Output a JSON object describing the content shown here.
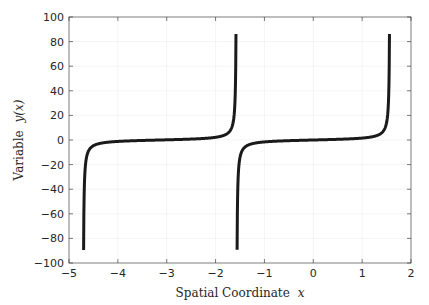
{
  "chart_data": {
    "type": "line",
    "title": "",
    "xlabel": "Spatial Coordinate",
    "xlabel_math": "x",
    "ylabel": "Variable",
    "ylabel_math": "y(x)",
    "xlim": [
      -5,
      2
    ],
    "ylim": [
      -100,
      100
    ],
    "xticks": [
      -5,
      -4,
      -3,
      -2,
      -1,
      0,
      1,
      2
    ],
    "xtick_labels": [
      "−5",
      "−4",
      "−3",
      "−2",
      "−1",
      "0",
      "1",
      "2"
    ],
    "yticks": [
      -100,
      -80,
      -60,
      -40,
      -20,
      0,
      20,
      40,
      60,
      80,
      100
    ],
    "ytick_labels": [
      "−100",
      "−80",
      "−60",
      "−40",
      "−20",
      "0",
      "20",
      "40",
      "60",
      "80",
      "100"
    ],
    "grid": true,
    "legend": "none",
    "function": "y = tan(x)",
    "series": [
      {
        "name": "branch-1",
        "color": "#1a1a1a",
        "x_range": [
          -4.7012,
          -1.5824
        ],
        "description": "tan(x) branch between asymptotes at -3π/2 and -π/2",
        "points": [
          [
            -4.7012,
            -100
          ],
          [
            -4.7,
            -85
          ],
          [
            -4.69,
            -50
          ],
          [
            -4.67,
            -25
          ],
          [
            -4.62,
            -11
          ],
          [
            -4.5,
            -4.6
          ],
          [
            -4.3,
            -2.3
          ],
          [
            -4.0,
            -1.16
          ],
          [
            -3.6,
            -0.49
          ],
          [
            -3.14,
            0
          ],
          [
            -2.7,
            0.47
          ],
          [
            -2.3,
            1.12
          ],
          [
            -2.0,
            2.19
          ],
          [
            -1.8,
            4.29
          ],
          [
            -1.7,
            7.7
          ],
          [
            -1.65,
            12.6
          ],
          [
            -1.61,
            25.5
          ],
          [
            -1.59,
            52
          ],
          [
            -1.5824,
            86
          ]
        ]
      },
      {
        "name": "branch-2",
        "color": "#1a1a1a",
        "x_range": [
          -1.5596,
          1.5592
        ],
        "description": "tan(x) branch between asymptotes at -π/2 and π/2",
        "points": [
          [
            -1.5608,
            -100
          ],
          [
            -1.555,
            -63
          ],
          [
            -1.54,
            -32.5
          ],
          [
            -1.52,
            -19.7
          ],
          [
            -1.48,
            -11
          ],
          [
            -1.4,
            -5.8
          ],
          [
            -1.2,
            -2.57
          ],
          [
            -0.9,
            -1.26
          ],
          [
            -0.5,
            -0.55
          ],
          [
            0,
            0
          ],
          [
            0.5,
            0.55
          ],
          [
            0.9,
            1.26
          ],
          [
            1.2,
            2.57
          ],
          [
            1.4,
            5.8
          ],
          [
            1.48,
            11
          ],
          [
            1.52,
            19.7
          ],
          [
            1.54,
            32.5
          ],
          [
            1.555,
            63
          ],
          [
            1.5592,
            86
          ]
        ]
      }
    ]
  }
}
